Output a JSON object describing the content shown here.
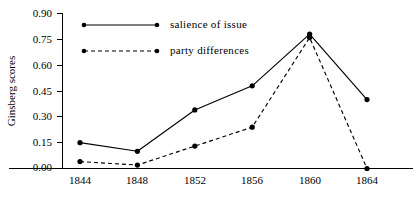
{
  "chart_data": {
    "type": "line",
    "title": "",
    "subtitle": "",
    "xlabel": "",
    "ylabel": "Ginsberg scores",
    "categories": [
      "1844",
      "1848",
      "1852",
      "1856",
      "1860",
      "1864"
    ],
    "x": [
      1844,
      1848,
      1852,
      1856,
      1860,
      1864
    ],
    "xlim": [
      1842,
      1866
    ],
    "ylim": [
      0.0,
      0.9
    ],
    "yticks": [
      0.0,
      0.15,
      0.3,
      0.45,
      0.6,
      0.75,
      0.9
    ],
    "ytick_labels": [
      "0.00",
      "0.15",
      "0.30",
      "0.45",
      "0.60",
      "0.75",
      "0.90"
    ],
    "xtick_labels": [
      "1844",
      "1848",
      "1852",
      "1856",
      "1860",
      "1864"
    ],
    "grid": false,
    "legend_position": "top-center",
    "series": [
      {
        "name": "salience of issue",
        "style": "solid",
        "color": "#000000",
        "marker": "circle",
        "values": [
          0.15,
          0.1,
          0.34,
          0.48,
          0.78,
          0.4
        ]
      },
      {
        "name": "party differences",
        "style": "dashed",
        "color": "#000000",
        "marker": "circle",
        "values": [
          0.04,
          0.02,
          0.13,
          0.24,
          0.76,
          0.0
        ]
      }
    ],
    "annotations": []
  },
  "legend": {
    "entries": [
      {
        "label": "salience of issue"
      },
      {
        "label": "party differences"
      }
    ]
  },
  "axes": {
    "y_title": "Ginsberg scores"
  }
}
